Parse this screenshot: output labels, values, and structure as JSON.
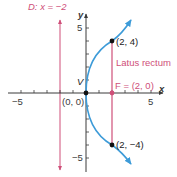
{
  "diagram": {
    "type": "parabola",
    "equation_hint": "y^2 = 8x",
    "colors": {
      "axis": "#3a3a3a",
      "curve": "#3d9bd8",
      "accent": "#cf4f79",
      "point": "#111111"
    },
    "axes": {
      "x_label": "x",
      "y_label": "y",
      "x_tick_labels": {
        "neg": "−5",
        "pos": "5"
      },
      "y_tick_labels": {
        "pos": "5",
        "neg": "−5"
      },
      "range": [
        -6,
        6
      ]
    },
    "directrix": {
      "label": "D: x = −2",
      "x": -2
    },
    "vertex": {
      "label": "V",
      "coord_label": "(0, 0)"
    },
    "focus": {
      "label": "F = (2, 0)"
    },
    "latus_rectum": {
      "label": "Latus rectum",
      "top_point": "(2, 4)",
      "bottom_point": "(2, −4)"
    }
  }
}
